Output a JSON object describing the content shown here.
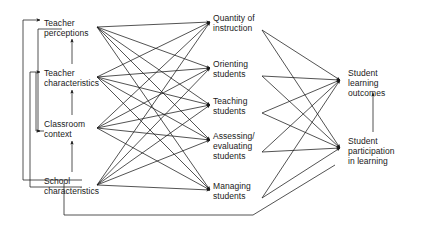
{
  "diagram": {
    "type": "path-diagram",
    "line_color": "#1a1a1a",
    "text_color": "#1a1a1a",
    "background": "#ffffff",
    "columns": [
      {
        "id": "antecedents",
        "name": "antecedent-variables",
        "nodes": [
          {
            "id": "teacher_perceptions",
            "label": "Teacher\nperceptions",
            "x": 44,
            "y": 18,
            "anchor_x": 97,
            "anchor_y": 27
          },
          {
            "id": "teacher_characteristics",
            "label": "Teacher\ncharacteristics",
            "x": 44,
            "y": 68,
            "anchor_x": 97,
            "anchor_y": 77
          },
          {
            "id": "classroom_context",
            "label": "Classroom\ncontext",
            "x": 44,
            "y": 119,
            "anchor_x": 97,
            "anchor_y": 128
          },
          {
            "id": "school_characteristics",
            "label": "School\ncharacteristics",
            "x": 44,
            "y": 176,
            "anchor_x": 97,
            "anchor_y": 185
          }
        ]
      },
      {
        "id": "teaching_processes",
        "name": "teaching-process-variables",
        "nodes": [
          {
            "id": "quantity_of_instruction",
            "label": "Quantity of\ninstruction",
            "x": 213,
            "y": 13,
            "in_x": 210,
            "in_y": 22,
            "out_x": 262,
            "out_y": 30
          },
          {
            "id": "orienting_students",
            "label": "Orienting\nstudents",
            "x": 213,
            "y": 59,
            "in_x": 210,
            "in_y": 68,
            "out_x": 262,
            "out_y": 76
          },
          {
            "id": "teaching_students",
            "label": "Teaching\nstudents",
            "x": 213,
            "y": 96,
            "in_x": 210,
            "in_y": 105,
            "out_x": 262,
            "out_y": 113
          },
          {
            "id": "assessing_evaluating",
            "label": "Assessing/\nevaluating\nstudents",
            "x": 213,
            "y": 131,
            "in_x": 210,
            "in_y": 140,
            "out_x": 262,
            "out_y": 152
          },
          {
            "id": "managing_students",
            "label": "Managing\nstudents",
            "x": 213,
            "y": 181,
            "in_x": 210,
            "in_y": 190,
            "out_x": 262,
            "out_y": 198
          }
        ]
      },
      {
        "id": "outcomes",
        "name": "student-outcome-variables",
        "nodes": [
          {
            "id": "student_learning_outcomes",
            "label": "Student\nlearning\noutcomes",
            "x": 348,
            "y": 68,
            "anchor_x": 340,
            "anchor_y": 80
          },
          {
            "id": "student_participation",
            "label": "Student\nparticipation\nin learning",
            "x": 348,
            "y": 136,
            "anchor_x": 340,
            "anchor_y": 148
          }
        ]
      }
    ],
    "edges": {
      "antecedent_to_process": [
        {
          "from": "teacher_perceptions",
          "to": "quantity_of_instruction"
        },
        {
          "from": "teacher_perceptions",
          "to": "orienting_students"
        },
        {
          "from": "teacher_perceptions",
          "to": "teaching_students"
        },
        {
          "from": "teacher_perceptions",
          "to": "assessing_evaluating"
        },
        {
          "from": "teacher_perceptions",
          "to": "managing_students"
        },
        {
          "from": "teacher_characteristics",
          "to": "quantity_of_instruction"
        },
        {
          "from": "teacher_characteristics",
          "to": "orienting_students"
        },
        {
          "from": "teacher_characteristics",
          "to": "teaching_students"
        },
        {
          "from": "teacher_characteristics",
          "to": "assessing_evaluating"
        },
        {
          "from": "teacher_characteristics",
          "to": "managing_students"
        },
        {
          "from": "classroom_context",
          "to": "quantity_of_instruction"
        },
        {
          "from": "classroom_context",
          "to": "orienting_students"
        },
        {
          "from": "classroom_context",
          "to": "teaching_students"
        },
        {
          "from": "classroom_context",
          "to": "assessing_evaluating"
        },
        {
          "from": "classroom_context",
          "to": "managing_students"
        },
        {
          "from": "school_characteristics",
          "to": "quantity_of_instruction"
        },
        {
          "from": "school_characteristics",
          "to": "orienting_students"
        },
        {
          "from": "school_characteristics",
          "to": "teaching_students"
        },
        {
          "from": "school_characteristics",
          "to": "assessing_evaluating"
        },
        {
          "from": "school_characteristics",
          "to": "managing_students"
        }
      ],
      "process_to_outcome": [
        {
          "from": "quantity_of_instruction",
          "to": "student_learning_outcomes"
        },
        {
          "from": "quantity_of_instruction",
          "to": "student_participation"
        },
        {
          "from": "orienting_students",
          "to": "student_learning_outcomes"
        },
        {
          "from": "orienting_students",
          "to": "student_participation"
        },
        {
          "from": "teaching_students",
          "to": "student_learning_outcomes"
        },
        {
          "from": "teaching_students",
          "to": "student_participation"
        },
        {
          "from": "assessing_evaluating",
          "to": "student_learning_outcomes"
        },
        {
          "from": "assessing_evaluating",
          "to": "student_participation"
        },
        {
          "from": "managing_students",
          "to": "student_learning_outcomes"
        },
        {
          "from": "managing_students",
          "to": "student_participation"
        }
      ],
      "vertical_internal": [
        {
          "from": "teacher_characteristics",
          "to": "teacher_perceptions"
        },
        {
          "from": "classroom_context",
          "to": "teacher_characteristics"
        },
        {
          "from": "school_characteristics",
          "to": "classroom_context"
        },
        {
          "from": "student_participation",
          "to": "student_learning_outcomes"
        }
      ],
      "feedback_loops": [
        {
          "id": "school-to-perceptions",
          "from": "school_characteristics",
          "to": "teacher_perceptions"
        },
        {
          "id": "school-to-characteristics",
          "from": "school_characteristics",
          "to": "teacher_characteristics"
        },
        {
          "id": "context-to-perceptions",
          "from": "classroom_context",
          "to": "teacher_perceptions"
        },
        {
          "id": "participation-to-context",
          "from": "student_participation",
          "to": "classroom_context"
        }
      ]
    }
  }
}
